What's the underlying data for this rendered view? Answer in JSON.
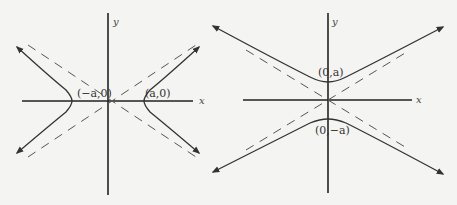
{
  "figures": [
    {
      "id": "horizontal-hyperbola",
      "axis_labels": {
        "x": "x",
        "y": "y"
      },
      "vertex_labels": {
        "left": "(−a,0)",
        "right": "(a,0)"
      }
    },
    {
      "id": "vertical-hyperbola",
      "axis_labels": {
        "x": "x",
        "y": "y"
      },
      "vertex_labels": {
        "top": "(0,a)",
        "bottom": "(0,−a)"
      }
    }
  ],
  "colors": {
    "curve": "#333333",
    "axis": "#222222",
    "asymptote": "#555555",
    "background": "#f4f4f2"
  }
}
